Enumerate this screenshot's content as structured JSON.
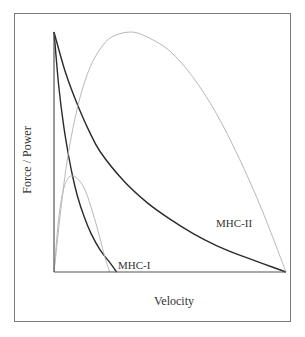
{
  "chart_data": {
    "type": "line",
    "title": "",
    "xlabel": "Velocity",
    "ylabel": "Force / Power",
    "xlim": [
      0,
      1
    ],
    "ylim": [
      0,
      1
    ],
    "grid": false,
    "legend": "none (inline curve labels)",
    "annotations": [
      {
        "text": "MHC-I",
        "x": 0.29,
        "y": 0.04
      },
      {
        "text": "MHC-II",
        "x": 0.7,
        "y": 0.2
      }
    ],
    "series": [
      {
        "name": "MHC-I force",
        "style": "dark solid",
        "x": [
          0,
          0.02,
          0.04,
          0.06,
          0.08,
          0.1,
          0.13,
          0.16,
          0.2,
          0.24,
          0.27
        ],
        "y": [
          1.0,
          0.78,
          0.62,
          0.5,
          0.4,
          0.32,
          0.23,
          0.16,
          0.09,
          0.04,
          0.0
        ]
      },
      {
        "name": "MHC-II force",
        "style": "dark solid",
        "x": [
          0,
          0.05,
          0.1,
          0.15,
          0.2,
          0.3,
          0.4,
          0.5,
          0.6,
          0.7,
          0.8,
          0.9,
          1.0
        ],
        "y": [
          1.0,
          0.83,
          0.7,
          0.59,
          0.5,
          0.38,
          0.29,
          0.22,
          0.16,
          0.11,
          0.07,
          0.035,
          0.0
        ]
      },
      {
        "name": "MHC-I power",
        "style": "light gray",
        "x": [
          0,
          0.02,
          0.04,
          0.06,
          0.08,
          0.1,
          0.13,
          0.16,
          0.19,
          0.22,
          0.24
        ],
        "y": [
          0.0,
          0.22,
          0.34,
          0.39,
          0.4,
          0.39,
          0.35,
          0.27,
          0.17,
          0.06,
          0.0
        ]
      },
      {
        "name": "MHC-II power",
        "style": "light gray",
        "x": [
          0,
          0.05,
          0.1,
          0.15,
          0.2,
          0.25,
          0.33,
          0.4,
          0.5,
          0.6,
          0.7,
          0.8,
          0.9,
          1.0
        ],
        "y": [
          0.0,
          0.42,
          0.68,
          0.84,
          0.93,
          0.98,
          1.0,
          0.98,
          0.92,
          0.81,
          0.66,
          0.47,
          0.25,
          0.0
        ]
      }
    ]
  },
  "labels": {
    "x_axis": "Velocity",
    "y_axis": "Force / Power",
    "mhc1": "MHC-I",
    "mhc2": "MHC-II"
  }
}
